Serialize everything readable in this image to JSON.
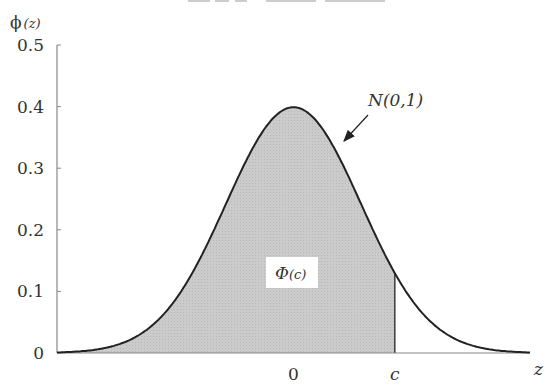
{
  "chart_data": {
    "type": "area",
    "title": "",
    "xlabel": "z",
    "ylabel": "ϕ(z)",
    "ylim": [
      0,
      0.5
    ],
    "xlim": [
      -3.5,
      3.5
    ],
    "yticks": [
      0,
      0.1,
      0.2,
      0.3,
      0.4,
      0.5
    ],
    "ytick_labels": [
      "0",
      "0.1",
      "0.2",
      "0.3",
      "0.4",
      "0.5"
    ],
    "xticks": [
      {
        "value": 0,
        "label": "0"
      },
      {
        "value": 1.5,
        "label": "c"
      }
    ],
    "series": [
      {
        "name": "N(0,1)",
        "function": "standard normal pdf",
        "mean": 0,
        "sd": 1
      }
    ],
    "shaded_region": {
      "from": -3.5,
      "to": 1.5,
      "label": "Φ(c)",
      "color": "#c8c8c8"
    },
    "annotations": [
      {
        "text": "N(0,1)",
        "points_to": "curve",
        "arrow": true
      },
      {
        "text": "Φ(c)",
        "type": "boxed-label",
        "inside": "shaded_region"
      }
    ],
    "grid": false,
    "colors": {
      "curve": "#222222",
      "axis": "#888888",
      "fill": "#c8c8c8"
    }
  },
  "labels": {
    "y_axis": "ϕ",
    "y_axis_arg": "(z)",
    "x_axis": "z",
    "curve_label": "N(0,1)",
    "area_label_main": "Φ",
    "area_label_arg": "(c)"
  }
}
